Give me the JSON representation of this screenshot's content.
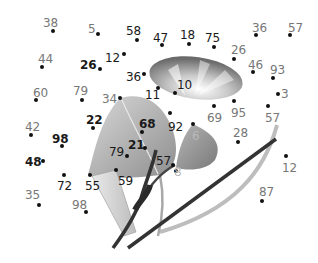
{
  "puzzle": {
    "type": "dot-to-dot",
    "subject": "morning glory flower with leaves and stems",
    "points": [
      {
        "label": "38",
        "x": 53,
        "y": 31,
        "lx": 43,
        "ly": 17,
        "tone": "gray"
      },
      {
        "label": "5",
        "x": 98,
        "y": 34,
        "lx": 88,
        "ly": 23,
        "tone": "gray"
      },
      {
        "label": "58",
        "x": 137,
        "y": 40,
        "lx": 126,
        "ly": 25,
        "tone": "dark"
      },
      {
        "label": "47",
        "x": 162,
        "y": 45,
        "lx": 153,
        "ly": 32,
        "tone": "dark"
      },
      {
        "label": "18",
        "x": 189,
        "y": 44,
        "lx": 180,
        "ly": 29,
        "tone": "dark"
      },
      {
        "label": "75",
        "x": 214,
        "y": 47,
        "lx": 205,
        "ly": 32,
        "tone": "dark"
      },
      {
        "label": "36",
        "x": 256,
        "y": 35,
        "lx": 252,
        "ly": 22,
        "tone": "gray"
      },
      {
        "label": "57",
        "x": 290,
        "y": 35,
        "lx": 288,
        "ly": 22,
        "tone": "gray"
      },
      {
        "label": "44",
        "x": 42,
        "y": 67,
        "lx": 38,
        "ly": 53,
        "tone": "gray"
      },
      {
        "label": "26",
        "x": 100,
        "y": 69,
        "lx": 80,
        "ly": 59,
        "tone": "dark",
        "bold": true
      },
      {
        "label": "12",
        "x": 124,
        "y": 54,
        "lx": 105,
        "ly": 52,
        "tone": "dark"
      },
      {
        "label": "26",
        "x": 234,
        "y": 59,
        "lx": 231,
        "ly": 44,
        "tone": "gray"
      },
      {
        "label": "36",
        "x": 144,
        "y": 74,
        "lx": 126,
        "ly": 71,
        "tone": "dark"
      },
      {
        "label": "46",
        "x": 253,
        "y": 72,
        "lx": 248,
        "ly": 59,
        "tone": "gray"
      },
      {
        "label": "93",
        "x": 273,
        "y": 78,
        "lx": 270,
        "ly": 64,
        "tone": "gray"
      },
      {
        "label": "60",
        "x": 36,
        "y": 100,
        "lx": 33,
        "ly": 87,
        "tone": "gray"
      },
      {
        "label": "79",
        "x": 82,
        "y": 100,
        "lx": 73,
        "ly": 85,
        "tone": "gray"
      },
      {
        "label": "34",
        "x": 120,
        "y": 98,
        "lx": 102,
        "ly": 93,
        "tone": "gray"
      },
      {
        "label": "11",
        "x": 158,
        "y": 88,
        "lx": 145,
        "ly": 89,
        "tone": "dark"
      },
      {
        "label": "10",
        "x": 175,
        "y": 93,
        "lx": 177,
        "ly": 79,
        "tone": "dark"
      },
      {
        "label": "3",
        "x": 278,
        "y": 94,
        "lx": 281,
        "ly": 88,
        "tone": "gray"
      },
      {
        "label": "69",
        "x": 214,
        "y": 106,
        "lx": 207,
        "ly": 112,
        "tone": "gray"
      },
      {
        "label": "95",
        "x": 234,
        "y": 101,
        "lx": 231,
        "ly": 107,
        "tone": "gray"
      },
      {
        "label": "57",
        "x": 268,
        "y": 106,
        "lx": 265,
        "ly": 112,
        "tone": "gray"
      },
      {
        "label": "42",
        "x": 31,
        "y": 135,
        "lx": 25,
        "ly": 121,
        "tone": "gray"
      },
      {
        "label": "22",
        "x": 93,
        "y": 128,
        "lx": 86,
        "ly": 114,
        "tone": "dark",
        "bold": true
      },
      {
        "label": "68",
        "x": 142,
        "y": 132,
        "lx": 139,
        "ly": 118,
        "tone": "dark",
        "bold": true
      },
      {
        "label": "92",
        "x": 170,
        "y": 113,
        "lx": 168,
        "ly": 121,
        "tone": "dark"
      },
      {
        "label": "6",
        "x": 193,
        "y": 124,
        "lx": 192,
        "ly": 130,
        "tone": "faint"
      },
      {
        "label": "28",
        "x": 238,
        "y": 142,
        "lx": 233,
        "ly": 127,
        "tone": "gray"
      },
      {
        "label": "98",
        "x": 62,
        "y": 146,
        "lx": 52,
        "ly": 133,
        "tone": "dark",
        "bold": true
      },
      {
        "label": "21",
        "x": 145,
        "y": 148,
        "lx": 128,
        "ly": 139,
        "tone": "dark",
        "bold": true
      },
      {
        "label": "79",
        "x": 127,
        "y": 156,
        "lx": 109,
        "ly": 146,
        "tone": "dark"
      },
      {
        "label": "57",
        "x": 173,
        "y": 165,
        "lx": 156,
        "ly": 155,
        "tone": "dark"
      },
      {
        "label": "8",
        "x": 176,
        "y": 171,
        "lx": 174,
        "ly": 166,
        "tone": "faint"
      },
      {
        "label": "12",
        "x": 286,
        "y": 156,
        "lx": 282,
        "ly": 162,
        "tone": "gray"
      },
      {
        "label": "48",
        "x": 43,
        "y": 161,
        "lx": 25,
        "ly": 156,
        "tone": "dark",
        "bold": true
      },
      {
        "label": "72",
        "x": 64,
        "y": 175,
        "lx": 57,
        "ly": 180,
        "tone": "dark"
      },
      {
        "label": "55",
        "x": 90,
        "y": 175,
        "lx": 85,
        "ly": 180,
        "tone": "dark"
      },
      {
        "label": "59",
        "x": 116,
        "y": 170,
        "lx": 118,
        "ly": 175,
        "tone": "dark"
      },
      {
        "label": "62",
        "x": 152,
        "y": 173,
        "lx": 152,
        "ly": 173,
        "tone": "none"
      },
      {
        "label": "35",
        "x": 39,
        "y": 205,
        "lx": 25,
        "ly": 189,
        "tone": "gray"
      },
      {
        "label": "98",
        "x": 86,
        "y": 212,
        "lx": 72,
        "ly": 199,
        "tone": "gray"
      },
      {
        "label": "87",
        "x": 262,
        "y": 201,
        "lx": 259,
        "ly": 186,
        "tone": "gray"
      }
    ]
  },
  "colors": {
    "dot": "#111111",
    "label_dark": "#1a1a1a",
    "label_gray": "#777777",
    "leaf_light": "#c9c9c9",
    "leaf_mid": "#9a9a9a",
    "stem_dark": "#333333"
  }
}
